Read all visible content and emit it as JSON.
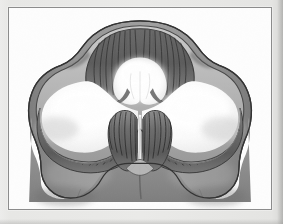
{
  "plate": {
    "title": "Cerebellum horizontal section",
    "caption": "",
    "background_color": "#e9e9e7",
    "plate_fill": "#fdfdfd",
    "border_color": "#8c8c8c"
  },
  "figure": {
    "name": "cerebellum-cross-section",
    "technique": "pen-and-ink with gray wash",
    "orientation": "anterior at top",
    "palette": {
      "surface_gray": "#8f8f8f",
      "surface_gray_light": "#a9a9a9",
      "surface_gray_dark": "#6f6f6f",
      "cortex_dark": "#4c4c4c",
      "cortex_mid": "#6a6a6a",
      "white_matter": "#fbfbfb",
      "white_matter_shade": "#e2e2e2",
      "outline": "#3a3a3a",
      "folia_line": "#414141"
    },
    "parts": [
      {
        "id": "superior-vermis",
        "label": "Superior vermis (culmen)"
      },
      {
        "id": "left-hemisphere",
        "label": "Left cerebellar hemisphere"
      },
      {
        "id": "right-hemisphere",
        "label": "Right cerebellar hemisphere"
      },
      {
        "id": "arbor-vitae-left",
        "label": "Arbor vitae, left"
      },
      {
        "id": "arbor-vitae-right",
        "label": "Arbor vitae, right"
      },
      {
        "id": "cortex-ribbon",
        "label": "Cerebellar cortex with folia"
      },
      {
        "id": "inferior-lobe-left",
        "label": "Inferior lobe, left"
      },
      {
        "id": "inferior-lobe-right",
        "label": "Inferior lobe, right"
      },
      {
        "id": "central-notch",
        "label": "Median notch / vermis"
      }
    ]
  }
}
